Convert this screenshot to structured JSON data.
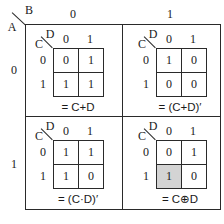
{
  "outer": {
    "row_var": "A",
    "col_var": "B",
    "col_headers": [
      "0",
      "1"
    ],
    "row_headers": [
      "0",
      "1"
    ]
  },
  "maps": [
    {
      "position": "A=0,B=0",
      "row_var": "C",
      "col_var": "D",
      "col_headers": [
        "0",
        "1"
      ],
      "row_headers": [
        "0",
        "1"
      ],
      "cells": [
        [
          "0",
          "1"
        ],
        [
          "1",
          "1"
        ]
      ],
      "shaded": [],
      "expression": "= C+D"
    },
    {
      "position": "A=0,B=1",
      "row_var": "C",
      "col_var": "D",
      "col_headers": [
        "0",
        "1"
      ],
      "row_headers": [
        "0",
        "1"
      ],
      "cells": [
        [
          "1",
          "0"
        ],
        [
          "0",
          "0"
        ]
      ],
      "shaded": [],
      "expression": "= (C+D)′"
    },
    {
      "position": "A=1,B=0",
      "row_var": "C",
      "col_var": "D",
      "col_headers": [
        "0",
        "1"
      ],
      "row_headers": [
        "0",
        "1"
      ],
      "cells": [
        [
          "1",
          "1"
        ],
        [
          "1",
          "0"
        ]
      ],
      "shaded": [],
      "expression": "= (C·D)′"
    },
    {
      "position": "A=1,B=1",
      "row_var": "C",
      "col_var": "D",
      "col_headers": [
        "0",
        "1"
      ],
      "row_headers": [
        "0",
        "1"
      ],
      "cells": [
        [
          "0",
          "1"
        ],
        [
          "1",
          "0"
        ]
      ],
      "shaded": [
        [
          1,
          0
        ]
      ],
      "expression": "= C⊕D"
    }
  ],
  "colors": {
    "line": "#2a2a2a",
    "shade": "#d4d4d4",
    "background": "#ffffff"
  }
}
